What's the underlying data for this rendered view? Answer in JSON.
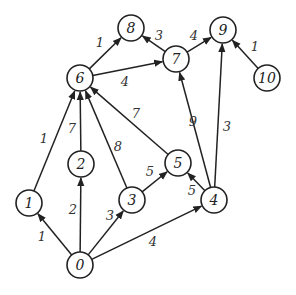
{
  "graph": {
    "type": "directed-weighted",
    "node_radius": 13,
    "colors": {
      "stroke": "#222222",
      "fill": "#ffffff",
      "text": "#222222"
    },
    "nodes": [
      {
        "id": "0",
        "x": 80,
        "y": 265
      },
      {
        "id": "1",
        "x": 29,
        "y": 203
      },
      {
        "id": "2",
        "x": 81,
        "y": 164
      },
      {
        "id": "3",
        "x": 132,
        "y": 200
      },
      {
        "id": "4",
        "x": 214,
        "y": 200
      },
      {
        "id": "5",
        "x": 178,
        "y": 163
      },
      {
        "id": "6",
        "x": 80,
        "y": 78
      },
      {
        "id": "7",
        "x": 176,
        "y": 59
      },
      {
        "id": "8",
        "x": 131,
        "y": 28
      },
      {
        "id": "9",
        "x": 223,
        "y": 30
      },
      {
        "id": "10",
        "x": 267,
        "y": 78
      }
    ],
    "edges": [
      {
        "from": "0",
        "to": "1",
        "weight": "1",
        "lx": 42,
        "ly": 236
      },
      {
        "from": "0",
        "to": "2",
        "weight": "2",
        "lx": 73,
        "ly": 209
      },
      {
        "from": "0",
        "to": "3",
        "weight": "3",
        "lx": 110,
        "ly": 215
      },
      {
        "from": "0",
        "to": "4",
        "weight": "4",
        "lx": 153,
        "ly": 241
      },
      {
        "from": "1",
        "to": "6",
        "weight": "1",
        "lx": 44,
        "ly": 138
      },
      {
        "from": "2",
        "to": "6",
        "weight": "7",
        "lx": 72,
        "ly": 128
      },
      {
        "from": "3",
        "to": "6",
        "weight": "8",
        "lx": 118,
        "ly": 146
      },
      {
        "from": "3",
        "to": "5",
        "weight": "5",
        "lx": 150,
        "ly": 171
      },
      {
        "from": "5",
        "to": "6",
        "weight": "7",
        "lx": 136,
        "ly": 113
      },
      {
        "from": "4",
        "to": "5",
        "weight": "5",
        "lx": 192,
        "ly": 190
      },
      {
        "from": "4",
        "to": "7",
        "weight": "9",
        "lx": 193,
        "ly": 121
      },
      {
        "from": "4",
        "to": "9",
        "weight": "3",
        "lx": 227,
        "ly": 126
      },
      {
        "from": "6",
        "to": "8",
        "weight": "1",
        "lx": 100,
        "ly": 42
      },
      {
        "from": "6",
        "to": "7",
        "weight": "4",
        "lx": 125,
        "ly": 81
      },
      {
        "from": "7",
        "to": "8",
        "weight": "3",
        "lx": 159,
        "ly": 35
      },
      {
        "from": "7",
        "to": "9",
        "weight": "4",
        "lx": 194,
        "ly": 35
      },
      {
        "from": "10",
        "to": "9",
        "weight": "1",
        "lx": 255,
        "ly": 46
      }
    ]
  }
}
